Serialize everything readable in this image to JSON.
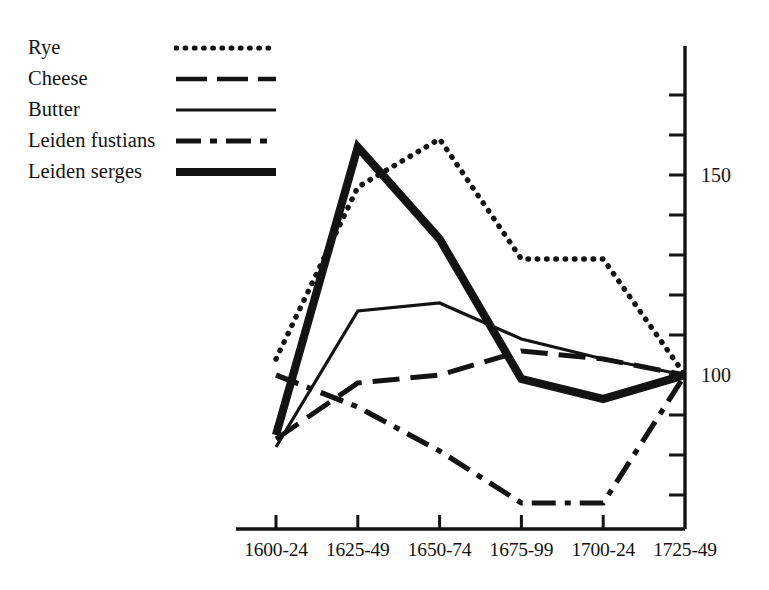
{
  "chart_data": {
    "type": "line",
    "title": "",
    "subtitle": "",
    "xlabel": "",
    "ylabel": "",
    "categories": [
      "1600-24",
      "1625-49",
      "1650-74",
      "1675-99",
      "1700-24",
      "1725-49"
    ],
    "ylim": [
      60,
      175
    ],
    "yticks": [
      70,
      80,
      90,
      100,
      110,
      120,
      130,
      140,
      150,
      160,
      170
    ],
    "ytick_labels_shown": [
      "100",
      "150"
    ],
    "grid": false,
    "legend_position": "top-left",
    "axis_position": {
      "y_axis": "right",
      "x_axis": "bottom"
    },
    "series": [
      {
        "name": "Rye",
        "style": "dotted",
        "values": [
          104,
          147,
          159,
          129,
          129,
          100
        ]
      },
      {
        "name": "Cheese",
        "style": "dashed",
        "values": [
          84,
          98,
          100,
          106,
          104,
          100
        ]
      },
      {
        "name": "Butter",
        "style": "solid-thin",
        "values": [
          82,
          116,
          118,
          109,
          104,
          100
        ]
      },
      {
        "name": "Leiden fustians",
        "style": "dash-dot",
        "values": [
          100,
          92,
          81,
          68,
          68,
          100
        ]
      },
      {
        "name": "Leiden serges",
        "style": "solid-thick",
        "values": [
          85,
          157,
          134,
          99,
          94,
          100
        ]
      }
    ]
  },
  "legend": {
    "items": [
      {
        "label": "Rye",
        "sample": "dotted-line-sample"
      },
      {
        "label": "Cheese",
        "sample": "dashed-line-sample"
      },
      {
        "label": "Butter",
        "sample": "solid-thin-line-sample"
      },
      {
        "label": "Leiden fustians",
        "sample": "dash-dot-line-sample"
      },
      {
        "label": "Leiden serges",
        "sample": "solid-thick-line-sample"
      }
    ]
  },
  "colors": {
    "ink": "#131313",
    "background": "#ffffff"
  }
}
